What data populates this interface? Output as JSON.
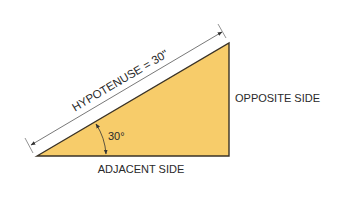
{
  "diagram": {
    "hypotenuse_label": "HYPOTENUSE = 30\"",
    "opposite_label": "OPPOSITE SIDE",
    "adjacent_label": "ADJACENT SIDE",
    "angle_label": "30°",
    "colors": {
      "triangle_fill": "#F7CC6A",
      "outline": "#3a3226",
      "dimension_line": "#555555",
      "text": "#2a2a2a",
      "background": "#FFFFFF"
    }
  }
}
